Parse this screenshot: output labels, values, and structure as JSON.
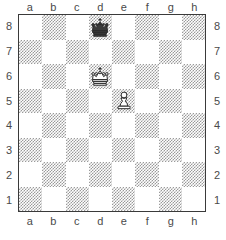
{
  "board": {
    "type": "chess-diagram",
    "orientation": "white-bottom",
    "files": [
      "a",
      "b",
      "c",
      "d",
      "e",
      "f",
      "g",
      "h"
    ],
    "ranks": [
      "8",
      "7",
      "6",
      "5",
      "4",
      "3",
      "2",
      "1"
    ],
    "light_square_color": "#ffffff",
    "dark_square_color": "#9a9a9a",
    "border_color": "#3a3a3a",
    "label_color": "#4a4a4a",
    "pieces": [
      {
        "square": "d8",
        "color": "black",
        "type": "king",
        "name": "black-king"
      },
      {
        "square": "d6",
        "color": "white",
        "type": "king",
        "name": "white-king"
      },
      {
        "square": "e5",
        "color": "white",
        "type": "pawn",
        "name": "white-pawn"
      }
    ],
    "fen": "3k4/8/3K4/4P3/8/8/8/8 w - - 0 1"
  }
}
